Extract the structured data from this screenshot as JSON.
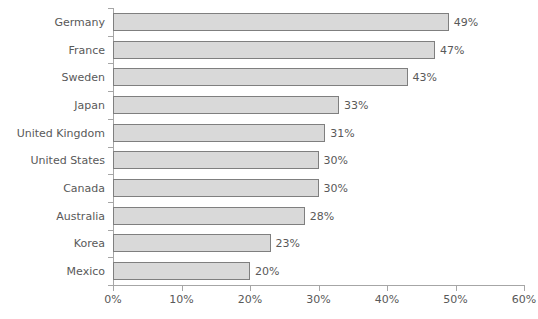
{
  "chart_data": {
    "type": "bar",
    "orientation": "horizontal",
    "title": "",
    "subtitle": "",
    "xlabel": "",
    "ylabel": "",
    "xlim": [
      0,
      60
    ],
    "xtick_step": 10,
    "grid": false,
    "legend": false,
    "value_labels": true,
    "value_label_suffix": "%",
    "categories": [
      "Germany",
      "France",
      "Sweden",
      "Japan",
      "United Kingdom",
      "United States",
      "Canada",
      "Australia",
      "Korea",
      "Mexico"
    ],
    "values": [
      49,
      47,
      43,
      33,
      31,
      30,
      30,
      28,
      23,
      20
    ],
    "value_labels_text": [
      "49%",
      "47%",
      "43%",
      "33%",
      "31%",
      "30%",
      "30%",
      "28%",
      "23%",
      "20%"
    ],
    "xtick_labels": [
      "0%",
      "10%",
      "20%",
      "30%",
      "40%",
      "50%",
      "60%"
    ],
    "xtick_values": [
      0,
      10,
      20,
      30,
      40,
      50,
      60
    ],
    "colors": {
      "bar_fill": "#d9d9d9",
      "bar_border": "#7f7f7f",
      "text": "#595959",
      "axis": "#a6a6a6",
      "background": "#ffffff"
    }
  }
}
